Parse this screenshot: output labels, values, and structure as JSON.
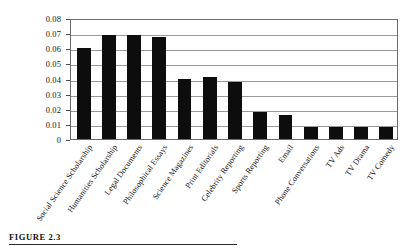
{
  "figure": {
    "caption_label": "FIGURE 2.3"
  },
  "chart_data": {
    "type": "bar",
    "title": "",
    "subtitle": "",
    "xlabel": "",
    "ylabel": "",
    "ylim": [
      0,
      0.08
    ],
    "grid": true,
    "legend": "none",
    "bar_color": "#0d0d0d",
    "y_ticks": [
      "0",
      "0.01",
      "0.02",
      "0.03",
      "0.04",
      "0.05",
      "0.06",
      "0.07",
      "0.08"
    ],
    "y_tick_values": [
      0,
      0.01,
      0.02,
      0.03,
      0.04,
      0.05,
      0.06,
      0.07,
      0.08
    ],
    "categories": [
      "Social Science Scholarship",
      "Humanities Scholarship",
      "Legal Documents",
      "Philosophical Essays",
      "Science Magazines",
      "Print Editorials",
      "Celebrity Reporting",
      "Sports Reporting",
      "Email",
      "Phone Conversations",
      "TV Ads",
      "TV Drama",
      "TV Comedy"
    ],
    "values": [
      0.06,
      0.0685,
      0.0685,
      0.0675,
      0.0395,
      0.041,
      0.038,
      0.018,
      0.0162,
      0.008,
      0.0082,
      0.0082,
      0.008
    ]
  }
}
